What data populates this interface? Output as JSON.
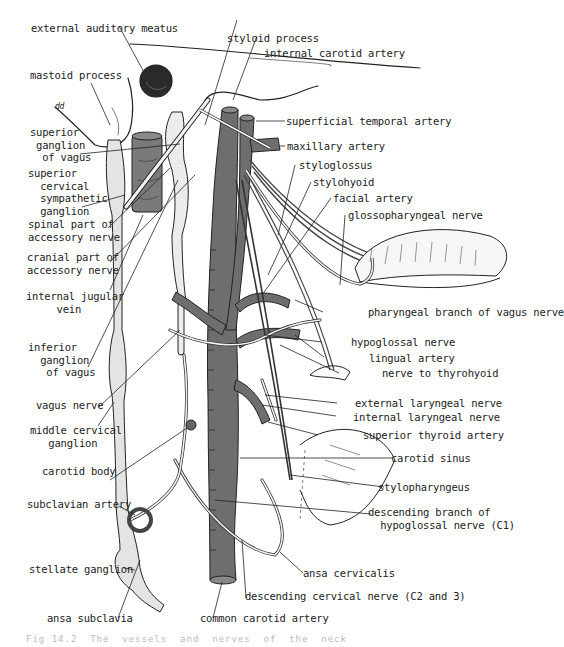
{
  "figure": {
    "colors": {
      "background": "#ffffff",
      "line": "#222222",
      "artery": "#6e6e6e",
      "vein": "#8a8a8a",
      "ganglion": "#dcdcdc",
      "muscle": "#5a5a5a"
    },
    "labels_left": {
      "external_auditory_meatus": "external auditory meatus",
      "mastoid_process": "mastoid process",
      "superior_ganglion_of_vagus": "superior\n ganglion\n  of vagus",
      "superior_cervical_sympathetic_ganglion": "superior\n  cervical\n  sympathetic\n  ganglion",
      "spinal_part_of_accessory_nerve": "spinal part of\naccessory nerve",
      "cranial_part_of_accessory_nerve": "cranial part of\naccessory nerve",
      "internal_jugular_vein": "internal jugular\n     vein",
      "inferior_ganglion_of_vagus": "inferior\n  ganglion\n   of vagus",
      "vagus_nerve": "vagus nerve",
      "middle_cervical_ganglion": "middle cervical\n   ganglion",
      "carotid_body": "carotid body",
      "subclavian_artery": "subclavian artery",
      "stellate_ganglion": "stellate ganglion",
      "ansa_subclavia": "ansa subclavia"
    },
    "labels_right": {
      "styloid_process": "styloid process",
      "internal_carotid_artery": "internal carotid artery",
      "superficial_temporal_artery": "superficial temporal artery",
      "maxillary_artery": "maxillary artery",
      "styloglossus": "styloglossus",
      "stylohyoid": "stylohyoid",
      "facial_artery": "facial artery",
      "glossopharyngeal_nerve": "glossopharyngeal nerve",
      "pharyngeal_branch_of_vagus_nerve": "pharyngeal branch of vagus nerve",
      "hypoglossal_nerve": "hypoglossal nerve",
      "lingual_artery": "lingual artery",
      "nerve_to_thyrohyoid": "nerve to thyrohyoid",
      "external_laryngeal_nerve": "external laryngeal nerve",
      "internal_laryngeal_nerve": "internal laryngeal nerve",
      "superior_thyroid_artery": "superior thyroid artery",
      "carotid_sinus": "carotid sinus",
      "stylopharyngeus": "stylopharyngeus",
      "descending_branch_of_hypoglossal_nerve": "descending branch of\n  hypoglossal nerve (C1)"
    },
    "labels_bottom": {
      "ansa_cervicalis": "ansa cervicalis",
      "descending_cervical_nerve": "descending cervical nerve (C2 and 3)",
      "common_carotid_artery": "common carotid artery"
    },
    "corner_mark": "dd",
    "caption": "Fig 14.2  The  vessels  and  nerves  of  the  neck"
  }
}
